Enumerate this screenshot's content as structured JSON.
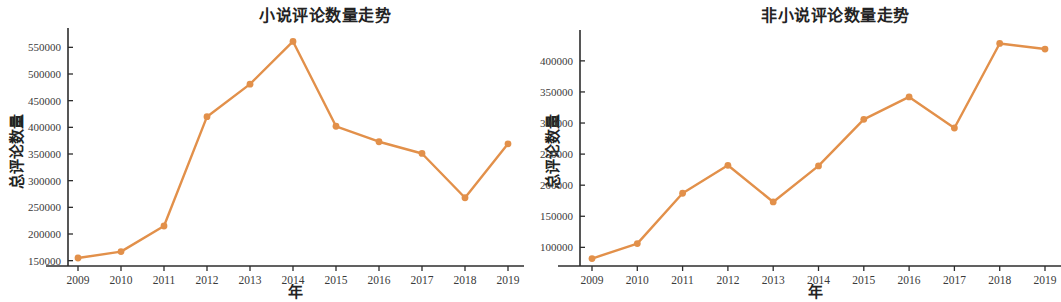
{
  "figure": {
    "background": "#ffffff",
    "series_color": "#e2904a",
    "axis_color": "#2c2c2c"
  },
  "panels": [
    {
      "id": "novel-comments-trend",
      "title": "小说评论数量走势",
      "xlabel": "年",
      "ylabel": "总评论数量"
    },
    {
      "id": "nonfiction-comments-trend",
      "title": "非小说评论数量走势",
      "xlabel": "年",
      "ylabel": "总评论数量"
    }
  ],
  "chart_data": [
    {
      "type": "line",
      "title": "小说评论数量走势",
      "xlabel": "年",
      "ylabel": "总评论数量",
      "categories": [
        "2009",
        "2010",
        "2011",
        "2012",
        "2013",
        "2014",
        "2015",
        "2016",
        "2017",
        "2018",
        "2019"
      ],
      "x": [
        2009,
        2010,
        2011,
        2012,
        2013,
        2014,
        2015,
        2016,
        2017,
        2018,
        2019
      ],
      "values": [
        155000,
        167000,
        215000,
        420000,
        481000,
        561000,
        402000,
        373000,
        351000,
        268000,
        369000
      ],
      "ylim": [
        140000,
        575000
      ],
      "yticks": [
        150000,
        200000,
        250000,
        300000,
        350000,
        400000,
        450000,
        500000,
        550000
      ],
      "ytick_labels": [
        "150000",
        "200000",
        "250000",
        "300000",
        "350000",
        "400000",
        "450000",
        "500000",
        "550000"
      ],
      "grid": false,
      "legend": "none",
      "color": "#e2904a",
      "marker": "circle"
    },
    {
      "type": "line",
      "title": "非小说评论数量走势",
      "xlabel": "年",
      "ylabel": "总评论数量",
      "categories": [
        "2009",
        "2010",
        "2011",
        "2012",
        "2013",
        "2014",
        "2015",
        "2016",
        "2017",
        "2018",
        "2019"
      ],
      "x": [
        2009,
        2010,
        2011,
        2012,
        2013,
        2014,
        2015,
        2016,
        2017,
        2018,
        2019
      ],
      "values": [
        82000,
        106000,
        187000,
        232000,
        173000,
        231000,
        306000,
        342000,
        292000,
        428000,
        419000
      ],
      "ylim": [
        70000,
        440000
      ],
      "yticks": [
        100000,
        150000,
        200000,
        250000,
        300000,
        350000,
        400000
      ],
      "ytick_labels": [
        "100000",
        "150000",
        "200000",
        "250000",
        "300000",
        "350000",
        "400000"
      ],
      "grid": false,
      "legend": "none",
      "color": "#e2904a",
      "marker": "circle"
    }
  ]
}
